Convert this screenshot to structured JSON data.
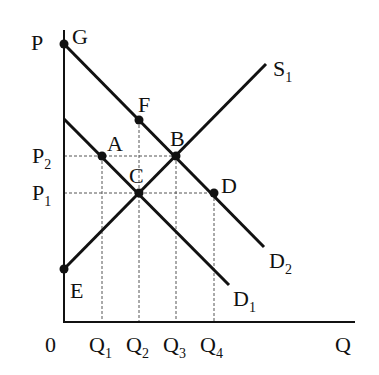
{
  "diagram": {
    "type": "supply-demand",
    "axes": {
      "y_label": "P",
      "x_label": "Q",
      "origin_label": "0"
    },
    "price_levels": [
      {
        "label": "P",
        "sub": "2",
        "y": 156
      },
      {
        "label": "P",
        "sub": "1",
        "y": 193
      }
    ],
    "quantity_levels": [
      {
        "label": "Q",
        "sub": "1",
        "x": 102
      },
      {
        "label": "Q",
        "sub": "2",
        "x": 139
      },
      {
        "label": "Q",
        "sub": "3",
        "x": 176
      },
      {
        "label": "Q",
        "sub": "4",
        "x": 214
      }
    ],
    "curves": [
      {
        "name": "S",
        "sub": "1",
        "from": [
          64,
          269
        ],
        "to": [
          266,
          64
        ]
      },
      {
        "name": "D",
        "sub": "1",
        "from": [
          64,
          119
        ],
        "to": [
          229,
          285
        ]
      },
      {
        "name": "D",
        "sub": "2",
        "from": [
          64,
          44
        ],
        "to": [
          264,
          247
        ]
      }
    ],
    "points": [
      {
        "label": "G",
        "x": 64,
        "y": 44
      },
      {
        "label": "F",
        "x": 139,
        "y": 120
      },
      {
        "label": "B",
        "x": 176,
        "y": 156
      },
      {
        "label": "A",
        "x": 102,
        "y": 156
      },
      {
        "label": "C",
        "x": 139,
        "y": 193
      },
      {
        "label": "D",
        "x": 214,
        "y": 193
      },
      {
        "label": "E",
        "x": 64,
        "y": 269
      }
    ]
  },
  "labels": {
    "P": "P",
    "Q": "Q",
    "zero": "0",
    "G": "G",
    "F": "F",
    "B": "B",
    "A": "A",
    "C": "C",
    "D": "D",
    "E": "E",
    "S": "S",
    "S_sub": "1",
    "D1": "D",
    "D1_sub": "1",
    "D2": "D",
    "D2_sub": "2",
    "P_main": "P",
    "P2_sub": "2",
    "P1_sub": "1",
    "Q_main": "Q",
    "Q1_sub": "1",
    "Q2_sub": "2",
    "Q3_sub": "3",
    "Q4_sub": "4"
  },
  "colors": {
    "line": "#111111",
    "guide": "#555555",
    "background": "#ffffff"
  }
}
